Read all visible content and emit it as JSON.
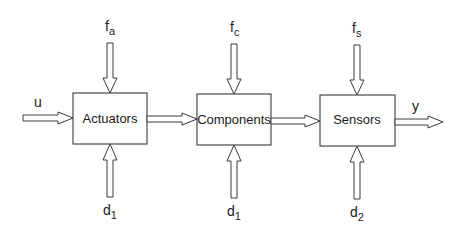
{
  "diagram": {
    "type": "block-diagram",
    "colors": {
      "stroke": "#3a3a3a",
      "text": "#1a1a1a",
      "background": "#ffffff"
    },
    "blocks": [
      {
        "id": "actuators",
        "label": "Actuators",
        "x": 73,
        "y": 93,
        "w": 74,
        "h": 51
      },
      {
        "id": "components",
        "label": "Components",
        "x": 197,
        "y": 94,
        "w": 74,
        "h": 51
      },
      {
        "id": "sensors",
        "label": "Sensors",
        "x": 320,
        "y": 95,
        "w": 75,
        "h": 51
      }
    ],
    "input": {
      "base": "u",
      "sub": ""
    },
    "output": {
      "base": "y",
      "sub": ""
    },
    "faults": [
      {
        "base": "f",
        "sub": "a",
        "target": "actuators"
      },
      {
        "base": "f",
        "sub": "c",
        "target": "components"
      },
      {
        "base": "f",
        "sub": "s",
        "target": "sensors"
      }
    ],
    "disturbances": [
      {
        "base": "d",
        "sub": "1",
        "target": "actuators"
      },
      {
        "base": "d",
        "sub": "1",
        "target": "components"
      },
      {
        "base": "d",
        "sub": "2",
        "target": "sensors"
      }
    ]
  }
}
